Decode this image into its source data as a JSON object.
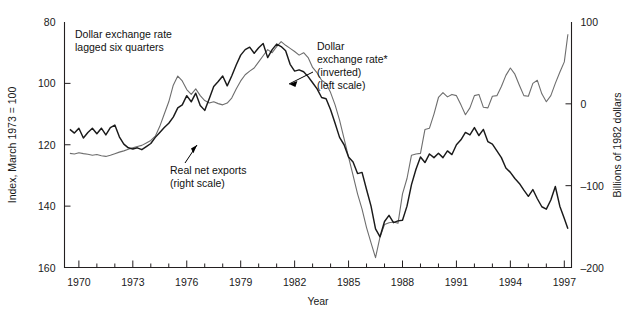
{
  "chart_data": {
    "type": "line",
    "title": "",
    "xlabel": "Year",
    "ylabel_left": "Index, March 1973 = 100",
    "ylabel_right": "Billions of 1982 dollars",
    "xlim": [
      1969.2,
      1997.4
    ],
    "xticks_major": [
      1970,
      1973,
      1976,
      1979,
      1982,
      1985,
      1988,
      1991,
      1994,
      1997
    ],
    "xticks_minor": [
      1971,
      1972,
      1974,
      1975,
      1977,
      1978,
      1980,
      1981,
      1983,
      1984,
      1986,
      1987,
      1989,
      1990,
      1992,
      1993,
      1995,
      1996
    ],
    "ylim_left": [
      160,
      80
    ],
    "yticks_left": [
      80,
      100,
      120,
      140,
      160
    ],
    "left_axis_inverted": true,
    "ylim_right": [
      -200,
      100
    ],
    "yticks_right": [
      100,
      0,
      -100,
      -200
    ],
    "grid": false,
    "legend_position": "inline annotations",
    "annotations": [
      {
        "name": "chart-caption",
        "text_lines": [
          "Dollar exchange rate",
          "lagged six quarters"
        ],
        "x": 1970.3,
        "y_index": 84.0
      },
      {
        "name": "exchange-rate-annotation",
        "text_lines": [
          "Dollar",
          "exchange rate*",
          "(inverted)",
          "(left scale)"
        ],
        "x": 1983.1,
        "y_index": 88.0
      },
      {
        "name": "net-exports-annotation",
        "text_lines": [
          "Real net exports",
          "(right scale)"
        ],
        "x": 1976.1,
        "y_index": 127.5
      }
    ],
    "series": [
      {
        "name": "Dollar exchange rate* (inverted), lagged six quarters",
        "axis": "left",
        "scale_label": "Index, March 1973 = 100",
        "color": "#6e6e6e",
        "points": [
          [
            1969.5,
            122.8
          ],
          [
            1969.75,
            123.0
          ],
          [
            1970.0,
            122.6
          ],
          [
            1970.25,
            122.9
          ],
          [
            1970.5,
            123.1
          ],
          [
            1970.75,
            123.4
          ],
          [
            1971.0,
            123.2
          ],
          [
            1971.25,
            123.6
          ],
          [
            1971.5,
            123.8
          ],
          [
            1971.75,
            123.4
          ],
          [
            1972.0,
            122.9
          ],
          [
            1972.25,
            122.4
          ],
          [
            1972.5,
            122.0
          ],
          [
            1972.75,
            121.5
          ],
          [
            1973.0,
            121.0
          ],
          [
            1973.25,
            120.6
          ],
          [
            1973.5,
            120.2
          ],
          [
            1973.75,
            119.4
          ],
          [
            1974.0,
            118.6
          ],
          [
            1974.25,
            117.2
          ],
          [
            1974.5,
            114.0
          ],
          [
            1974.75,
            110.0
          ],
          [
            1975.0,
            106.0
          ],
          [
            1975.25,
            100.6
          ],
          [
            1975.5,
            97.6
          ],
          [
            1975.75,
            99.2
          ],
          [
            1976.0,
            102.0
          ],
          [
            1976.25,
            103.6
          ],
          [
            1976.5,
            101.8
          ],
          [
            1976.75,
            104.0
          ],
          [
            1977.0,
            105.6
          ],
          [
            1977.25,
            106.4
          ],
          [
            1977.5,
            106.0
          ],
          [
            1977.75,
            106.6
          ],
          [
            1978.0,
            107.0
          ],
          [
            1978.25,
            106.4
          ],
          [
            1978.5,
            104.8
          ],
          [
            1978.75,
            101.8
          ],
          [
            1979.0,
            99.2
          ],
          [
            1979.25,
            97.2
          ],
          [
            1979.5,
            96.0
          ],
          [
            1979.75,
            95.0
          ],
          [
            1980.0,
            93.0
          ],
          [
            1980.25,
            91.0
          ],
          [
            1980.5,
            89.0
          ],
          [
            1980.75,
            90.0
          ],
          [
            1981.0,
            88.0
          ],
          [
            1981.25,
            86.4
          ],
          [
            1981.5,
            87.6
          ],
          [
            1981.75,
            88.6
          ],
          [
            1982.0,
            89.6
          ],
          [
            1982.25,
            90.8
          ],
          [
            1982.5,
            90.0
          ],
          [
            1982.75,
            91.6
          ],
          [
            1983.0,
            94.8
          ],
          [
            1983.25,
            96.6
          ],
          [
            1983.5,
            99.0
          ],
          [
            1983.75,
            100.0
          ],
          [
            1984.0,
            103.0
          ],
          [
            1984.25,
            107.0
          ],
          [
            1984.5,
            112.0
          ],
          [
            1984.75,
            118.0
          ],
          [
            1985.0,
            124.0
          ],
          [
            1985.25,
            130.0
          ],
          [
            1985.5,
            136.0
          ],
          [
            1985.75,
            141.0
          ],
          [
            1986.0,
            147.0
          ],
          [
            1986.25,
            152.0
          ],
          [
            1986.5,
            156.8
          ],
          [
            1986.75,
            150.0
          ],
          [
            1987.0,
            146.0
          ],
          [
            1987.25,
            145.4
          ],
          [
            1987.5,
            145.2
          ],
          [
            1987.75,
            145.6
          ],
          [
            1988.0,
            136.0
          ],
          [
            1988.25,
            131.0
          ],
          [
            1988.5,
            123.4
          ],
          [
            1988.75,
            123.0
          ],
          [
            1989.0,
            122.8
          ],
          [
            1989.25,
            115.0
          ],
          [
            1989.5,
            114.6
          ],
          [
            1989.75,
            110.0
          ],
          [
            1990.0,
            104.6
          ],
          [
            1990.25,
            103.0
          ],
          [
            1990.5,
            104.4
          ],
          [
            1990.75,
            103.6
          ],
          [
            1991.0,
            104.0
          ],
          [
            1991.25,
            107.0
          ],
          [
            1991.5,
            110.2
          ],
          [
            1991.75,
            108.0
          ],
          [
            1992.0,
            104.0
          ],
          [
            1992.25,
            103.6
          ],
          [
            1992.5,
            107.8
          ],
          [
            1992.75,
            108.0
          ],
          [
            1993.0,
            104.2
          ],
          [
            1993.25,
            104.0
          ],
          [
            1993.5,
            101.0
          ],
          [
            1993.75,
            97.4
          ],
          [
            1994.0,
            95.0
          ],
          [
            1994.25,
            97.0
          ],
          [
            1994.5,
            100.6
          ],
          [
            1994.75,
            104.0
          ],
          [
            1995.0,
            104.2
          ],
          [
            1995.25,
            100.0
          ],
          [
            1995.5,
            99.0
          ],
          [
            1995.75,
            103.4
          ],
          [
            1996.0,
            106.0
          ],
          [
            1996.25,
            104.0
          ],
          [
            1996.5,
            100.0
          ],
          [
            1996.75,
            96.4
          ],
          [
            1997.0,
            93.0
          ],
          [
            1997.2,
            84.0
          ]
        ]
      },
      {
        "name": "Real net exports",
        "axis": "right",
        "scale_label": "Billions of 1982 dollars",
        "color": "#1a1a1a",
        "points": [
          [
            1969.5,
            115.0
          ],
          [
            1969.75,
            116.2
          ],
          [
            1970.0,
            114.6
          ],
          [
            1970.25,
            117.8
          ],
          [
            1970.5,
            116.0
          ],
          [
            1970.75,
            114.6
          ],
          [
            1971.0,
            116.4
          ],
          [
            1971.25,
            114.6
          ],
          [
            1971.5,
            116.8
          ],
          [
            1971.75,
            114.4
          ],
          [
            1972.0,
            113.6
          ],
          [
            1972.25,
            117.4
          ],
          [
            1972.5,
            119.8
          ],
          [
            1972.75,
            121.0
          ],
          [
            1973.0,
            121.4
          ],
          [
            1973.25,
            121.0
          ],
          [
            1973.5,
            121.6
          ],
          [
            1973.75,
            120.6
          ],
          [
            1974.0,
            119.6
          ],
          [
            1974.25,
            117.6
          ],
          [
            1974.5,
            116.0
          ],
          [
            1974.75,
            114.4
          ],
          [
            1975.0,
            113.0
          ],
          [
            1975.25,
            111.0
          ],
          [
            1975.5,
            108.0
          ],
          [
            1975.75,
            107.0
          ],
          [
            1976.0,
            104.0
          ],
          [
            1976.25,
            106.0
          ],
          [
            1976.5,
            103.2
          ],
          [
            1976.75,
            107.2
          ],
          [
            1977.0,
            108.8
          ],
          [
            1977.25,
            105.0
          ],
          [
            1977.5,
            101.0
          ],
          [
            1977.75,
            99.4
          ],
          [
            1978.0,
            97.6
          ],
          [
            1978.25,
            100.8
          ],
          [
            1978.5,
            97.6
          ],
          [
            1978.75,
            94.0
          ],
          [
            1979.0,
            90.8
          ],
          [
            1979.25,
            89.0
          ],
          [
            1979.5,
            88.2
          ],
          [
            1979.75,
            90.2
          ],
          [
            1980.0,
            88.4
          ],
          [
            1980.25,
            87.0
          ],
          [
            1980.5,
            91.6
          ],
          [
            1980.75,
            89.0
          ],
          [
            1981.0,
            87.2
          ],
          [
            1981.25,
            88.0
          ],
          [
            1981.5,
            89.4
          ],
          [
            1981.75,
            93.8
          ],
          [
            1982.0,
            96.0
          ],
          [
            1982.25,
            95.6
          ],
          [
            1982.5,
            96.2
          ],
          [
            1982.75,
            97.8
          ],
          [
            1983.0,
            99.8
          ],
          [
            1983.25,
            101.8
          ],
          [
            1983.5,
            104.6
          ],
          [
            1983.75,
            105.0
          ],
          [
            1984.0,
            108.6
          ],
          [
            1984.25,
            113.0
          ],
          [
            1984.5,
            117.6
          ],
          [
            1984.75,
            120.0
          ],
          [
            1985.0,
            124.0
          ],
          [
            1985.25,
            125.6
          ],
          [
            1985.5,
            129.4
          ],
          [
            1985.75,
            129.0
          ],
          [
            1986.0,
            134.6
          ],
          [
            1986.25,
            140.0
          ],
          [
            1986.5,
            147.4
          ],
          [
            1986.75,
            150.0
          ],
          [
            1987.0,
            145.0
          ],
          [
            1987.25,
            143.0
          ],
          [
            1987.5,
            145.4
          ],
          [
            1987.75,
            144.8
          ],
          [
            1988.0,
            144.6
          ],
          [
            1988.25,
            140.0
          ],
          [
            1988.5,
            133.0
          ],
          [
            1988.75,
            128.0
          ],
          [
            1989.0,
            124.0
          ],
          [
            1989.25,
            125.8
          ],
          [
            1989.5,
            123.0
          ],
          [
            1989.75,
            124.2
          ],
          [
            1990.0,
            122.8
          ],
          [
            1990.25,
            124.2
          ],
          [
            1990.5,
            122.0
          ],
          [
            1990.75,
            123.2
          ],
          [
            1991.0,
            120.0
          ],
          [
            1991.25,
            118.4
          ],
          [
            1991.5,
            116.0
          ],
          [
            1991.75,
            116.8
          ],
          [
            1992.0,
            114.4
          ],
          [
            1992.25,
            117.0
          ],
          [
            1992.5,
            115.0
          ],
          [
            1992.75,
            119.0
          ],
          [
            1993.0,
            119.8
          ],
          [
            1993.25,
            122.0
          ],
          [
            1993.5,
            124.2
          ],
          [
            1993.75,
            127.6
          ],
          [
            1994.0,
            129.0
          ],
          [
            1994.25,
            131.0
          ],
          [
            1994.5,
            132.6
          ],
          [
            1994.75,
            134.8
          ],
          [
            1995.0,
            136.8
          ],
          [
            1995.25,
            134.6
          ],
          [
            1995.5,
            137.6
          ],
          [
            1995.75,
            140.2
          ],
          [
            1996.0,
            141.0
          ],
          [
            1996.25,
            138.0
          ],
          [
            1996.5,
            133.6
          ],
          [
            1996.75,
            140.0
          ],
          [
            1997.0,
            144.0
          ],
          [
            1997.2,
            147.4
          ]
        ]
      }
    ]
  },
  "axes": {
    "left": {
      "title": "Index, March 1973 = 100",
      "tick_labels": [
        "80",
        "100",
        "120",
        "140",
        "160"
      ]
    },
    "right": {
      "title": "Billions of 1982 dollars",
      "tick_labels": [
        "100",
        "0",
        "–100",
        "–200"
      ]
    },
    "bottom": {
      "title": "Year",
      "tick_labels": [
        "1970",
        "1973",
        "1976",
        "1979",
        "1982",
        "1985",
        "1988",
        "1991",
        "1994",
        "1997"
      ]
    }
  },
  "annotations": {
    "caption": {
      "line1": "Dollar exchange rate",
      "line2": "lagged six quarters"
    },
    "exchange_rate": {
      "line1": "Dollar",
      "line2": "exchange rate*",
      "line3": "(inverted)",
      "line4": "(left scale)"
    },
    "net_exports": {
      "line1": "Real net exports",
      "line2": "(right scale)"
    }
  },
  "colors": {
    "exchange_rate_line": "#6e6e6e",
    "net_exports_line": "#1a1a1a",
    "axis": "#231f20",
    "background": "#ffffff"
  }
}
